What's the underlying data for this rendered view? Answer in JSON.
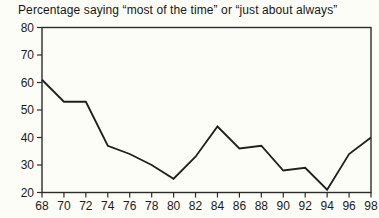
{
  "chart_data": {
    "type": "line",
    "title": "Percentage saying “most of the time” or “just about always”",
    "xlabel": "",
    "ylabel": "",
    "categories": [
      "68",
      "70",
      "72",
      "74",
      "76",
      "78",
      "80",
      "82",
      "84",
      "86",
      "88",
      "90",
      "92",
      "94",
      "96",
      "98"
    ],
    "values": [
      61,
      53,
      53,
      37,
      34,
      30,
      25,
      33,
      44,
      36,
      37,
      28,
      29,
      21,
      34,
      40
    ],
    "ylim": [
      20,
      80
    ],
    "ytick_step": 10,
    "yticks": [
      20,
      30,
      40,
      50,
      60,
      70,
      80
    ],
    "grid": false,
    "legend_position": "none",
    "line_color": "#1f1f1f",
    "axis_color": "#2b2b2b",
    "text_color": "#1a1a1a",
    "background_color": "#fdfdf8"
  }
}
